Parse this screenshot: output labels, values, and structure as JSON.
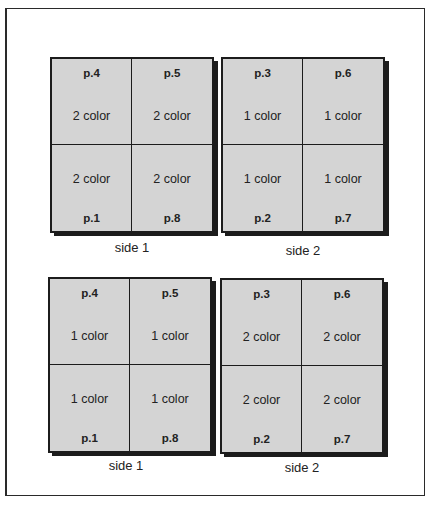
{
  "diagram": {
    "colors": {
      "sheet_fill": "#d4d4d4",
      "lines": "#1c1c1c",
      "background": "#ffffff"
    },
    "rows": [
      {
        "sheets": [
          {
            "label": "side 1",
            "cells": [
              {
                "page": "p.4",
                "color": "2 color"
              },
              {
                "page": "p.5",
                "color": "2 color"
              },
              {
                "page": "p.1",
                "color": "2 color"
              },
              {
                "page": "p.8",
                "color": "2 color"
              }
            ]
          },
          {
            "label": "side 2",
            "cells": [
              {
                "page": "p.3",
                "color": "1 color"
              },
              {
                "page": "p.6",
                "color": "1 color"
              },
              {
                "page": "p.2",
                "color": "1 color"
              },
              {
                "page": "p.7",
                "color": "1 color"
              }
            ]
          }
        ]
      },
      {
        "sheets": [
          {
            "label": "side 1",
            "cells": [
              {
                "page": "p.4",
                "color": "1 color"
              },
              {
                "page": "p.5",
                "color": "1 color"
              },
              {
                "page": "p.1",
                "color": "1 color"
              },
              {
                "page": "p.8",
                "color": "1 color"
              }
            ]
          },
          {
            "label": "side 2",
            "cells": [
              {
                "page": "p.3",
                "color": "2 color"
              },
              {
                "page": "p.6",
                "color": "2 color"
              },
              {
                "page": "p.2",
                "color": "2 color"
              },
              {
                "page": "p.7",
                "color": "2 color"
              }
            ]
          }
        ]
      }
    ]
  }
}
